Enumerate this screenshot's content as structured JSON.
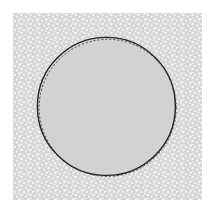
{
  "diagram": {
    "canvas": {
      "width": 213,
      "height": 212,
      "background": "#ffffff"
    },
    "region": {
      "shape": "square",
      "x": 13,
      "y": 13,
      "width": 189,
      "height": 187,
      "fill": "#d6d6d6",
      "texture": "stipple-dots",
      "dot_color": "#f4f4f4"
    },
    "circle": {
      "cx": 107,
      "cy": 107,
      "r": 69,
      "fill": "#d2d2d2",
      "outline_solid_color": "#222222",
      "outline_dashed_color": "#444444"
    }
  }
}
